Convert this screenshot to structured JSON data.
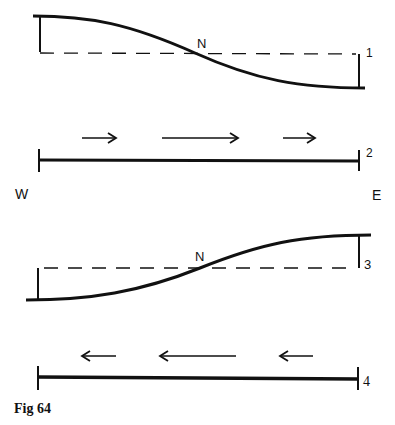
{
  "figure": {
    "caption": "Fig 64",
    "direction_labels": {
      "west": "W",
      "east": "E"
    },
    "panels": [
      {
        "id": "1",
        "label": "1",
        "type": "surface-profile",
        "node_label": "N",
        "slope": "high-west-low-east"
      },
      {
        "id": "2",
        "label": "2",
        "type": "current-flow",
        "arrow_direction": "east",
        "arrow_count": 3
      },
      {
        "id": "3",
        "label": "3",
        "type": "surface-profile",
        "node_label": "N",
        "slope": "low-west-high-east"
      },
      {
        "id": "4",
        "label": "4",
        "type": "current-flow",
        "arrow_direction": "west",
        "arrow_count": 3
      }
    ]
  },
  "colors": {
    "ink": "#111111",
    "background": "#ffffff"
  }
}
